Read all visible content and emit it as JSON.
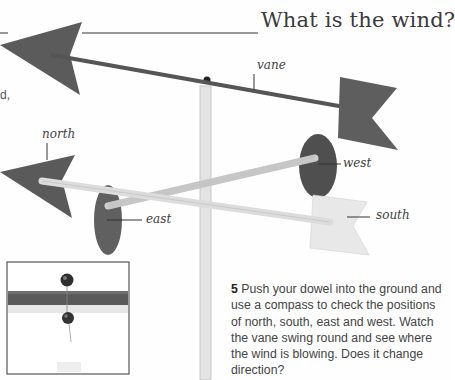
{
  "page": {
    "title": "What is the wind?",
    "cut_off_text": "d,",
    "labels": {
      "vane": "vane",
      "north": "north",
      "west": "west",
      "east": "east",
      "south": "south"
    },
    "step": {
      "number": "5",
      "text": " Push your dowel into the ground and use a compass to check the positions of north, south, east and west. Watch the vane swing round and see where the wind is blowing. Does it change direction?"
    },
    "inset": {
      "caption": "Fig. 1"
    },
    "colors": {
      "arrow_dark": "#5a5a5a",
      "disc_dark": "#595959",
      "dowel": "#d9d9d9",
      "pale_arrow": "#e6e6e6",
      "text": "#444444"
    }
  }
}
